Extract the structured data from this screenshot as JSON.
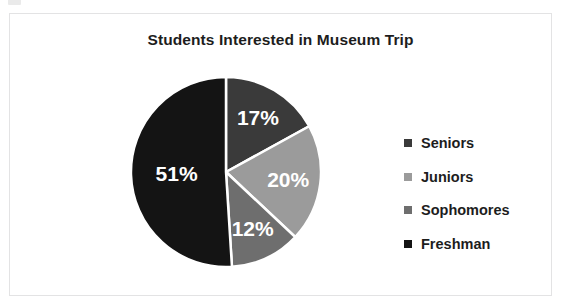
{
  "chart_data": {
    "type": "pie",
    "title": "Students Interested in Museum Trip",
    "categories": [
      "Seniors",
      "Juniors",
      "Sophomores",
      "Freshman"
    ],
    "values": [
      17,
      20,
      12,
      51
    ],
    "value_labels": [
      "17%",
      "20%",
      "12%",
      "51%"
    ],
    "colors": [
      "#3a3a3a",
      "#9b9b9b",
      "#6e6e6e",
      "#141414"
    ],
    "units": "percent",
    "legend_position": "right",
    "start_angle_deg": 0,
    "direction": "clockwise",
    "grid": false,
    "xlabel": "",
    "ylabel": ""
  },
  "frame": {
    "border_color": "#e3e3e4",
    "background": "#ffffff"
  },
  "legend": {
    "items": [
      {
        "label": "Seniors",
        "color": "#3a3a3a"
      },
      {
        "label": "Juniors",
        "color": "#9b9b9b"
      },
      {
        "label": "Sophomores",
        "color": "#6e6e6e"
      },
      {
        "label": "Freshman",
        "color": "#141414"
      }
    ]
  }
}
